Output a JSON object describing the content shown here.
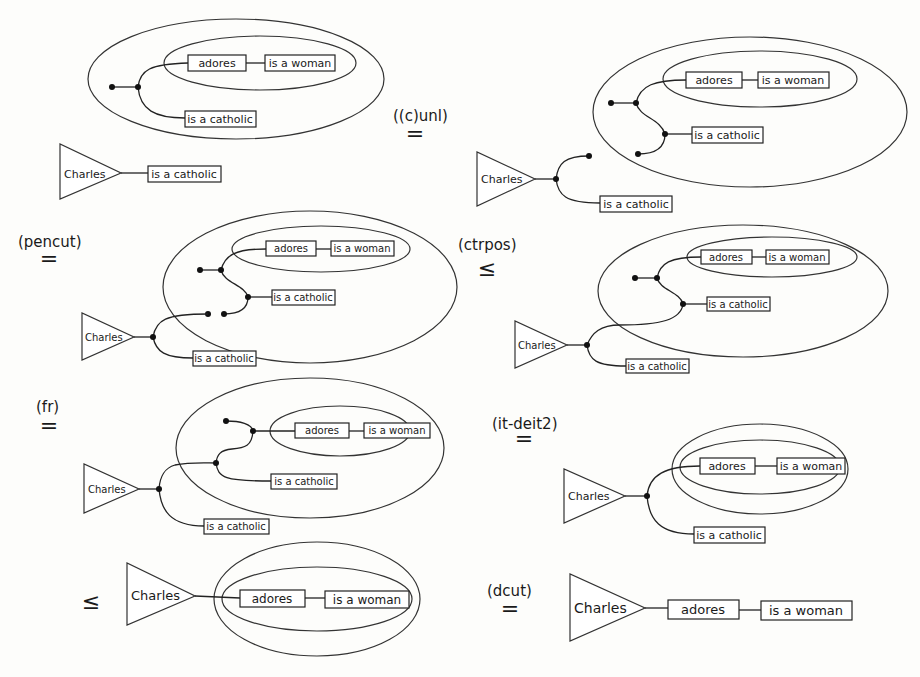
{
  "figure": {
    "labels": {
      "charles": "Charles",
      "adores": "adores",
      "is_a_woman": "is a woman",
      "is_a_catholic": "is a catholic"
    },
    "steps": [
      {
        "id": 1,
        "rule": "",
        "relation": ""
      },
      {
        "id": 2,
        "rule": "((c)unl)",
        "relation": "="
      },
      {
        "id": 3,
        "rule": "(pencut)",
        "relation": "="
      },
      {
        "id": 4,
        "rule": "(ctrpos)",
        "relation": "≤"
      },
      {
        "id": 5,
        "rule": "(fr)",
        "relation": "="
      },
      {
        "id": 6,
        "rule": "(it-deit2)",
        "relation": "="
      },
      {
        "id": 7,
        "rule": "",
        "relation": "≤"
      },
      {
        "id": 8,
        "rule": "(dcut)",
        "relation": "="
      }
    ]
  }
}
